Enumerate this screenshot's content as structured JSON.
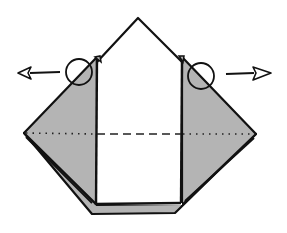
{
  "diagram": {
    "type": "origami-step",
    "colors": {
      "line": "#111111",
      "fill_gray": "#b4b4b4",
      "fill_white": "#ffffff",
      "background": "#ffffff"
    },
    "symbols": {
      "left_arrow": "open-arrow-left",
      "right_arrow": "open-arrow-right",
      "left_circle": "focus-circle",
      "right_circle": "focus-circle",
      "fold_line_outer": "dotted (mountain fold)",
      "fold_line_center": "dashed (valley fold)"
    }
  }
}
